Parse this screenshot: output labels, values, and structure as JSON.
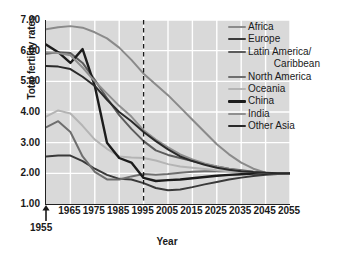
{
  "chart_data": {
    "type": "line",
    "title": "",
    "xlabel": "Year",
    "ylabel": "Total fertility rates",
    "xlim": [
      1955,
      2055
    ],
    "ylim": [
      1.0,
      7.0
    ],
    "grid": true,
    "legend_position": "top-right",
    "yticks": [
      "1.00",
      "2.00",
      "3.00",
      "4.00",
      "5.00",
      "6.00",
      "7.00"
    ],
    "ytick_values": [
      1,
      2,
      3,
      4,
      5,
      6,
      7
    ],
    "xticks": [
      "1965",
      "1975",
      "1985",
      "1995",
      "2005",
      "2015",
      "2025",
      "2035",
      "2045",
      "2055"
    ],
    "xtick_values": [
      1965,
      1975,
      1985,
      1995,
      2005,
      2015,
      2025,
      2035,
      2045,
      2055
    ],
    "origin_annotation": "1955",
    "annotations": [
      {
        "name": "vertical-dashed-line",
        "x": 1995,
        "style": "dashed"
      },
      {
        "name": "origin-arrow",
        "x": 1955,
        "label": "1955"
      }
    ],
    "x": [
      1955,
      1960,
      1965,
      1970,
      1975,
      1980,
      1985,
      1990,
      1995,
      2000,
      2005,
      2010,
      2015,
      2020,
      2025,
      2030,
      2035,
      2040,
      2045,
      2050,
      2055
    ],
    "series": [
      {
        "name": "Africa",
        "color": "#8a8a8a",
        "width": 2.0,
        "values": [
          6.7,
          6.76,
          6.8,
          6.75,
          6.6,
          6.4,
          6.1,
          5.7,
          5.25,
          4.9,
          4.55,
          4.15,
          3.75,
          3.35,
          2.95,
          2.62,
          2.35,
          2.15,
          2.02,
          2.0,
          2.0
        ]
      },
      {
        "name": "Europe",
        "color": "#3a3a3a",
        "width": 2.0,
        "values": [
          2.55,
          2.58,
          2.58,
          2.4,
          2.15,
          1.95,
          1.82,
          1.8,
          1.68,
          1.52,
          1.45,
          1.47,
          1.55,
          1.64,
          1.72,
          1.8,
          1.86,
          1.91,
          1.95,
          1.98,
          2.0
        ]
      },
      {
        "name": "Latin America/ Caribbean",
        "color": "#5c5c5c",
        "width": 2.0,
        "values": [
          5.9,
          5.95,
          5.92,
          5.6,
          5.05,
          4.45,
          3.9,
          3.45,
          3.05,
          2.75,
          2.6,
          2.5,
          2.4,
          2.3,
          2.22,
          2.15,
          2.1,
          2.05,
          2.02,
          2.0,
          2.0
        ]
      },
      {
        "name": "North America",
        "color": "#6e6e6e",
        "width": 2.0,
        "values": [
          3.5,
          3.7,
          3.35,
          2.55,
          2.05,
          1.8,
          1.8,
          1.9,
          1.98,
          1.95,
          1.98,
          2.02,
          2.05,
          2.07,
          2.08,
          2.07,
          2.05,
          2.03,
          2.01,
          2.0,
          2.0
        ]
      },
      {
        "name": "Oceania",
        "color": "#b4b4b4",
        "width": 2.0,
        "values": [
          3.85,
          4.05,
          3.95,
          3.55,
          3.1,
          2.8,
          2.55,
          2.52,
          2.5,
          2.42,
          2.3,
          2.22,
          2.18,
          2.14,
          2.1,
          2.07,
          2.05,
          2.03,
          2.01,
          2.0,
          2.0
        ]
      },
      {
        "name": "China",
        "color": "#1c1c1c",
        "width": 2.4,
        "values": [
          6.2,
          5.95,
          5.6,
          6.05,
          4.85,
          3.0,
          2.5,
          2.35,
          1.85,
          1.75,
          1.78,
          1.8,
          1.84,
          1.88,
          1.92,
          1.95,
          1.97,
          1.99,
          2.0,
          2.0,
          2.0
        ]
      },
      {
        "name": "India",
        "color": "#8f8f8f",
        "width": 2.0,
        "values": [
          5.95,
          5.92,
          5.85,
          5.45,
          5.0,
          4.6,
          4.2,
          3.85,
          3.4,
          3.1,
          2.85,
          2.62,
          2.45,
          2.32,
          2.22,
          2.14,
          2.08,
          2.04,
          2.01,
          2.0,
          2.0
        ]
      },
      {
        "name": "Other Asia",
        "color": "#2a2a2a",
        "width": 2.0,
        "values": [
          5.5,
          5.48,
          5.4,
          5.15,
          4.85,
          4.4,
          4.0,
          3.7,
          3.35,
          3.05,
          2.78,
          2.55,
          2.4,
          2.28,
          2.18,
          2.12,
          2.07,
          2.04,
          2.02,
          2.0,
          2.0
        ]
      }
    ]
  },
  "legend": {
    "entries": [
      {
        "label": "Africa"
      },
      {
        "label": "Europe"
      },
      {
        "label": "Latin America/"
      },
      {
        "label": "Caribbean"
      },
      {
        "label": "North America"
      },
      {
        "label": "Oceania"
      },
      {
        "label": "China"
      },
      {
        "label": "India"
      },
      {
        "label": "Other Asia"
      }
    ]
  },
  "axes": {
    "y_title": "Total fertility rates",
    "x_title": "Year",
    "origin_label": "1955"
  },
  "colors": {
    "plot_background": "#d9d9d9",
    "gridline": "#ffffff",
    "axis": "#222222",
    "text": "#1a1a1a",
    "page_background": "#ffffff"
  }
}
